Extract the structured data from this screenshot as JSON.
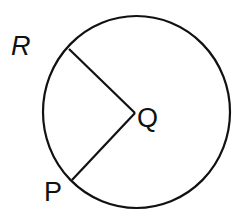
{
  "diagram": {
    "type": "circle-with-radii",
    "labels": {
      "center": "Q",
      "point_upper": "R",
      "point_lower": "P"
    },
    "colors": {
      "stroke": "#111111",
      "background": "#ffffff"
    }
  }
}
